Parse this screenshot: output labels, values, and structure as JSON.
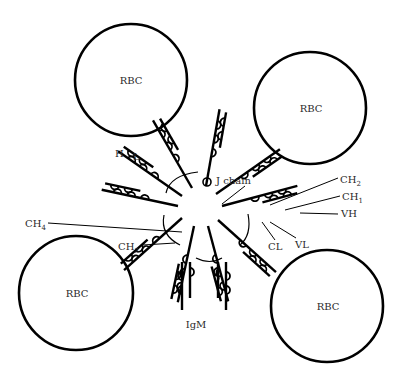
{
  "diagram": {
    "colors": {
      "stroke": "#000000",
      "text": "#2a2a2a",
      "background": "#ffffff"
    },
    "center": [
      200,
      205
    ],
    "rbcs": [
      {
        "id": "rbc-top-left",
        "label": "RBC",
        "cx": 131,
        "cy": 80,
        "r": 56
      },
      {
        "id": "rbc-top-right",
        "label": "RBC",
        "cx": 310,
        "cy": 108,
        "r": 56
      },
      {
        "id": "rbc-bottom-left",
        "label": "RBC",
        "cx": 76,
        "cy": 293,
        "r": 57
      },
      {
        "id": "rbc-bottom-right",
        "label": "RBC",
        "cx": 327,
        "cy": 306,
        "r": 56
      }
    ],
    "labels": {
      "h": "H",
      "l": "L",
      "j_chain": "J chain",
      "ch2_main": "CH",
      "ch2_sub": "2",
      "ch1_main": "CH",
      "ch1_sub": "1",
      "vh": "VH",
      "cl": "CL",
      "vl": "VL",
      "ch4_main": "CH",
      "ch4_sub": "4",
      "ch3_main": "CH",
      "ch3_sub": "3",
      "igm": "IgM"
    }
  }
}
